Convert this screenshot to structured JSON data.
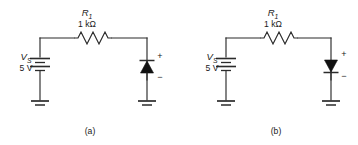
{
  "figure": {
    "background_color": "#ffffff",
    "line_color": "#2b2b2b",
    "fill_color": "#111111"
  },
  "circuits": [
    {
      "id": "a",
      "caption": "(a)",
      "source": {
        "symbol": "battery",
        "name": "V",
        "name_subscript": "S",
        "value": "5 V"
      },
      "resistor": {
        "symbol": "zigzag-resistor",
        "name": "R",
        "name_subscript": "1",
        "value": "1 kΩ"
      },
      "diode": {
        "symbol": "diode",
        "orientation": "up",
        "cathode_position": "top",
        "plus_label": "+",
        "minus_label": "−"
      },
      "grounds": [
        {
          "symbol": "ground",
          "position": "left"
        },
        {
          "symbol": "ground",
          "position": "right"
        }
      ]
    },
    {
      "id": "b",
      "caption": "(b)",
      "source": {
        "symbol": "battery",
        "name": "V",
        "name_subscript": "S",
        "value": "5 V"
      },
      "resistor": {
        "symbol": "zigzag-resistor",
        "name": "R",
        "name_subscript": "1",
        "value": "1 kΩ"
      },
      "diode": {
        "symbol": "diode",
        "orientation": "down",
        "cathode_position": "bottom",
        "plus_label": "+",
        "minus_label": "−"
      },
      "grounds": [
        {
          "symbol": "ground",
          "position": "left"
        },
        {
          "symbol": "ground",
          "position": "right"
        }
      ]
    }
  ]
}
